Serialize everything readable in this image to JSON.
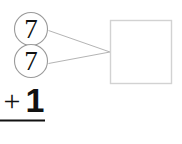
{
  "worksheet": {
    "type": "addition-with-number-bond",
    "bond_parts": [
      {
        "id": "part-top",
        "value": "7"
      },
      {
        "id": "part-bottom",
        "value": "7"
      }
    ],
    "bond_total": {
      "value": "",
      "placeholder": "",
      "label": "answer-box"
    },
    "equation": {
      "operator": "+",
      "addend": "1",
      "rule_line": true
    }
  },
  "colors": {
    "ink": "#111111",
    "circle_stroke": "#9a9a9a",
    "connector_stroke": "#b4b4b4",
    "box_stroke": "#d2d2d2",
    "rule_line": "#111111",
    "background": "#ffffff"
  },
  "geometry": {
    "circle_diameter": 34,
    "box_width": 62,
    "box_height": 64,
    "connector_join_x": 110,
    "connector_join_y": 52
  }
}
